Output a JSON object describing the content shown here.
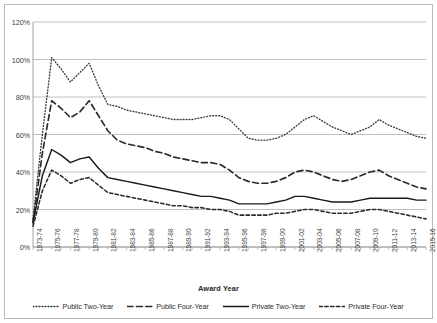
{
  "chart_data": {
    "type": "line",
    "title": "",
    "xlabel": "Award Year",
    "ylabel": "",
    "ylim": [
      0,
      120
    ],
    "ytick_labels": [
      "0%",
      "20%",
      "40%",
      "60%",
      "80%",
      "100%",
      "120%"
    ],
    "ytick_values": [
      0,
      20,
      40,
      60,
      80,
      100,
      120
    ],
    "grid": true,
    "legend_position": "bottom",
    "categories": [
      "1973-74",
      "1974-75",
      "1975-76",
      "1976-77",
      "1977-78",
      "1978-79",
      "1979-80",
      "1980-81",
      "1981-82",
      "1982-83",
      "1983-84",
      "1984-85",
      "1985-86",
      "1986-87",
      "1987-88",
      "1988-89",
      "1989-90",
      "1990-91",
      "1991-92",
      "1992-93",
      "1993-94",
      "1994-95",
      "1995-96",
      "1996-97",
      "1997-98",
      "1998-99",
      "1999-00",
      "2000-01",
      "2001-02",
      "2002-03",
      "2003-04",
      "2004-05",
      "2005-06",
      "2006-07",
      "2007-08",
      "2008-09",
      "2009-10",
      "2010-11",
      "2011-12",
      "2012-13",
      "2013-14",
      "2014-15",
      "2015-16"
    ],
    "tick_labels_shown": [
      "1973-74",
      "1975-76",
      "1977-78",
      "1979-80",
      "1981-82",
      "1983-84",
      "1985-86",
      "1987-88",
      "1989-90",
      "1991-92",
      "1993-94",
      "1995-96",
      "1997-98",
      "1999-00",
      "2001-02",
      "2003-04",
      "2005-06",
      "2007-08",
      "2009-10",
      "2011-12",
      "2013-14",
      "2015-16"
    ],
    "series": [
      {
        "name": "Public Two-Year",
        "style": "dotted",
        "color": "#3a3a3a",
        "values": [
          15,
          60,
          101,
          95,
          88,
          93,
          98,
          86,
          76,
          75,
          73,
          72,
          71,
          70,
          69,
          68,
          68,
          68,
          69,
          70,
          70,
          68,
          63,
          58,
          57,
          57,
          58,
          60,
          64,
          68,
          70,
          67,
          64,
          62,
          60,
          62,
          64,
          68,
          65,
          63,
          61,
          59,
          58
        ]
      },
      {
        "name": "Public Four-Year",
        "style": "dashed",
        "color": "#2b2b2b",
        "values": [
          13,
          50,
          78,
          74,
          69,
          72,
          78,
          70,
          62,
          57,
          55,
          54,
          53,
          51,
          50,
          48,
          47,
          46,
          45,
          45,
          44,
          41,
          37,
          35,
          34,
          34,
          35,
          37,
          40,
          41,
          40,
          38,
          36,
          35,
          36,
          38,
          40,
          41,
          38,
          36,
          34,
          32,
          31
        ]
      },
      {
        "name": "Private Two-Year",
        "style": "solid",
        "color": "#1a1a1a",
        "values": [
          13,
          38,
          52,
          49,
          45,
          47,
          48,
          42,
          37,
          36,
          35,
          34,
          33,
          32,
          31,
          30,
          29,
          28,
          27,
          27,
          26,
          25,
          23,
          23,
          23,
          23,
          24,
          25,
          27,
          27,
          26,
          25,
          24,
          24,
          24,
          25,
          26,
          26,
          26,
          26,
          26,
          25,
          25
        ]
      },
      {
        "name": "Private Four-Year",
        "style": "shortdash",
        "color": "#2b2b2b",
        "values": [
          11,
          30,
          41,
          38,
          34,
          36,
          37,
          33,
          29,
          28,
          27,
          26,
          25,
          24,
          23,
          22,
          22,
          21,
          21,
          20,
          20,
          19,
          17,
          17,
          17,
          17,
          18,
          18,
          19,
          20,
          20,
          19,
          18,
          18,
          18,
          19,
          20,
          20,
          19,
          18,
          17,
          16,
          15
        ]
      }
    ]
  },
  "legend": {
    "items": [
      {
        "label": "Public Two-Year"
      },
      {
        "label": "Public Four-Year"
      },
      {
        "label": "Private Two-Year"
      },
      {
        "label": "Private Four-Year"
      }
    ]
  }
}
